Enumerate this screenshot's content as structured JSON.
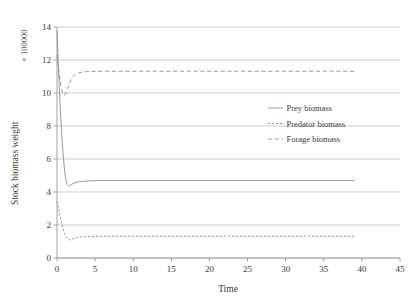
{
  "chart_data": {
    "type": "line",
    "title": "",
    "xlabel": "Time",
    "ylabel": "Stock biomass weight",
    "y_multiplier": "× 100000",
    "xlim": [
      0,
      45
    ],
    "ylim": [
      0,
      14
    ],
    "xticks": [
      0,
      5,
      10,
      15,
      20,
      25,
      30,
      35,
      40,
      45
    ],
    "yticks": [
      0,
      2,
      4,
      6,
      8,
      10,
      12,
      14
    ],
    "xtick_labels": [
      "0",
      "5",
      "10",
      "15",
      "20",
      "25",
      "30",
      "35",
      "40",
      "45"
    ],
    "ytick_labels": [
      "0",
      "2",
      "4",
      "6",
      "8",
      "10",
      "12",
      "14"
    ],
    "grid": "horizontal",
    "legend_position": "center-right-inside",
    "series": [
      {
        "name": "Prey biomass",
        "style": "solid",
        "color": "#8f8f8f",
        "x": [
          0,
          0.15,
          0.3,
          0.45,
          0.6,
          0.75,
          0.9,
          1.05,
          1.2,
          1.35,
          1.5,
          1.7,
          1.9,
          2.1,
          2.4,
          2.8,
          3.3,
          4.0,
          5.0,
          6.5,
          8.0,
          10.0,
          13.0,
          17.0,
          22.0,
          28.0,
          33.0,
          36.0,
          39.0
        ],
        "y": [
          13.8,
          12.0,
          10.35,
          8.9,
          7.65,
          6.6,
          5.75,
          5.1,
          4.68,
          4.46,
          4.38,
          4.4,
          4.45,
          4.5,
          4.56,
          4.61,
          4.65,
          4.67,
          4.69,
          4.7,
          4.7,
          4.7,
          4.7,
          4.7,
          4.7,
          4.7,
          4.7,
          4.7,
          4.7
        ]
      },
      {
        "name": "Predator biomass",
        "style": "dotted",
        "color": "#8f8f8f",
        "x": [
          0,
          0.15,
          0.3,
          0.45,
          0.6,
          0.75,
          0.9,
          1.05,
          1.2,
          1.4,
          1.6,
          1.8,
          2.0,
          2.3,
          2.7,
          3.2,
          4.0,
          5.0,
          6.5,
          8.0,
          10.0,
          13.0,
          17.0,
          22.0,
          28.0,
          33.0,
          36.0,
          39.0
        ],
        "y": [
          3.42,
          3.08,
          2.74,
          2.42,
          2.12,
          1.86,
          1.62,
          1.44,
          1.29,
          1.16,
          1.1,
          1.11,
          1.15,
          1.2,
          1.25,
          1.28,
          1.3,
          1.31,
          1.32,
          1.32,
          1.32,
          1.32,
          1.32,
          1.32,
          1.32,
          1.32,
          1.32,
          1.32
        ]
      },
      {
        "name": "Forage biomass",
        "style": "dashed",
        "color": "#8f8f8f",
        "x": [
          0,
          0.15,
          0.3,
          0.45,
          0.6,
          0.75,
          0.9,
          1.05,
          1.2,
          1.4,
          1.6,
          1.85,
          2.1,
          2.4,
          2.8,
          3.3,
          4.0,
          5.0,
          6.5,
          8.0,
          10.0,
          13.0,
          17.0,
          22.0,
          28.0,
          33.0,
          36.0,
          39.0
        ],
        "y": [
          12.3,
          11.7,
          11.1,
          10.6,
          10.22,
          9.98,
          9.88,
          9.9,
          10.02,
          10.28,
          10.55,
          10.82,
          11.0,
          11.13,
          11.22,
          11.27,
          11.3,
          11.31,
          11.32,
          11.32,
          11.32,
          11.32,
          11.32,
          11.32,
          11.32,
          11.32,
          11.32,
          11.32
        ]
      }
    ]
  },
  "legend": {
    "items": [
      {
        "label": "Prey biomass",
        "style": "solid"
      },
      {
        "label": "Predator biomass",
        "style": "dotted"
      },
      {
        "label": "Forage biomass",
        "style": "dashed"
      }
    ]
  }
}
